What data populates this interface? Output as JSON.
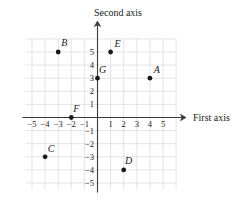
{
  "chart_data": {
    "type": "scatter",
    "title": "",
    "xlabel": "First axis",
    "ylabel": "Second axis",
    "xlim": [
      -5.5,
      6
    ],
    "ylim": [
      -5.5,
      6
    ],
    "grid": true,
    "legend": "none",
    "xticks": [
      -5,
      -4,
      -3,
      -2,
      -1,
      1,
      2,
      3,
      4,
      5
    ],
    "yticks": [
      5,
      4,
      3,
      2,
      1,
      -1,
      -2,
      -3,
      -4,
      -5
    ],
    "xtick_labels": [
      "−5",
      "−4",
      "−3",
      "−2",
      "−1",
      "1",
      "2",
      "3",
      "4",
      "5"
    ],
    "ytick_labels": [
      "5",
      "4",
      "3",
      "2",
      "1",
      "−1",
      "−2",
      "−3",
      "−4",
      "−5"
    ],
    "point_color": "#1a1a1a",
    "grid_color": "#d9d9de",
    "axis_color": "#3a3a3a",
    "points": [
      {
        "label": "A",
        "x": 4,
        "y": 3,
        "label_dx": 7,
        "label_dy": -5
      },
      {
        "label": "B",
        "x": -3,
        "y": 5,
        "label_dx": 6,
        "label_dy": -6
      },
      {
        "label": "C",
        "x": -4,
        "y": -3,
        "label_dx": 6,
        "label_dy": -5
      },
      {
        "label": "D",
        "x": 2,
        "y": -4,
        "label_dx": 5,
        "label_dy": -6
      },
      {
        "label": "E",
        "x": 1,
        "y": 5,
        "label_dx": 7,
        "label_dy": -5
      },
      {
        "label": "F",
        "x": -2,
        "y": 0,
        "label_dx": 5,
        "label_dy": -6
      },
      {
        "label": "G",
        "x": 0,
        "y": 3,
        "label_dx": 5,
        "label_dy": -5
      }
    ]
  },
  "axes": {
    "x_title": "First axis",
    "y_title": "Second axis"
  }
}
